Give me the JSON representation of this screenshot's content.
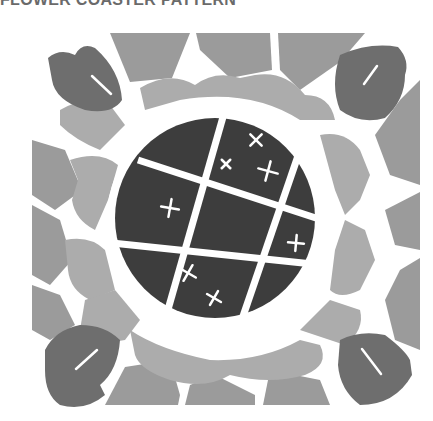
{
  "page": {
    "title": "FLOWER COASTER PATTERN"
  },
  "colors": {
    "background": "#ffffff",
    "center": "#3d3d3d",
    "leaves": "#6e6e6e",
    "outer_tiles": "#9b9b9b",
    "inner_petals": "#acacac",
    "grout": "#ffffff",
    "title": "#6a6a6a"
  },
  "pattern": {
    "center_marks": [
      "x",
      "x",
      "x",
      "+",
      "+",
      "x",
      "x"
    ],
    "corner_leaves": [
      "top-left",
      "top-right",
      "bottom-left",
      "bottom-right"
    ]
  }
}
